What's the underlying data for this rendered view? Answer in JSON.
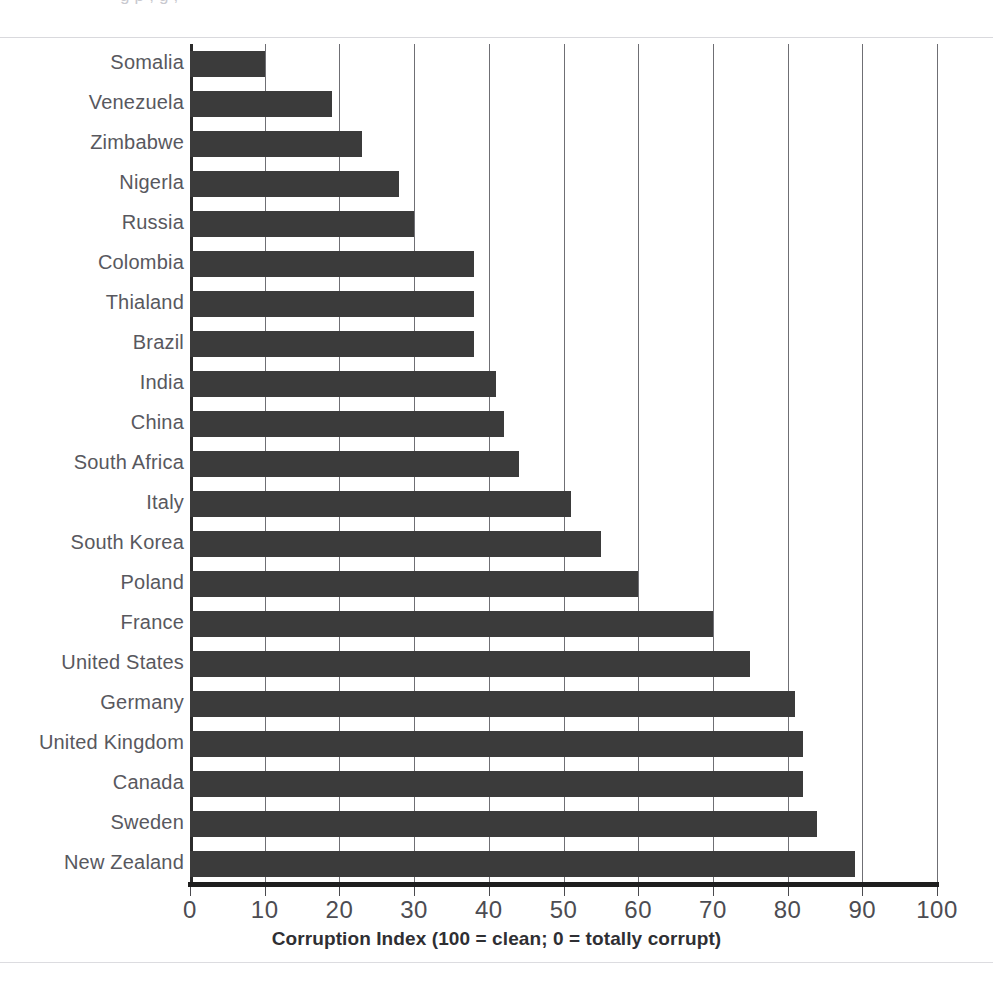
{
  "figure": {
    "top_clipped_text": "g                p                                  ,   g    ,",
    "background_color": "#ffffff",
    "bar_color": "#3b3b3b",
    "gridline_color": "#6f6f74",
    "axis_color": "#1e1e1e",
    "label_color": "#58585e"
  },
  "chart_data": {
    "type": "bar",
    "orientation": "horizontal",
    "title": "",
    "subtitle": "",
    "xlabel": "Corruption Index (100 = clean; 0 = totally corrupt)",
    "ylabel": "",
    "xlim": [
      0,
      100
    ],
    "xticks": [
      0,
      10,
      20,
      30,
      40,
      50,
      60,
      70,
      80,
      90,
      100
    ],
    "xticklabels": [
      "0",
      "10",
      "20",
      "30",
      "40",
      "50",
      "60",
      "70",
      "80",
      "90",
      "100"
    ],
    "grid": "vertical",
    "legend": "none",
    "categories": [
      "Somalia",
      "Venezuela",
      "Zimbabwe",
      "Nigerla",
      "Russia",
      "Colombia",
      "Thialand",
      "Brazil",
      "India",
      "China",
      "South Africa",
      "Italy",
      "South Korea",
      "Poland",
      "France",
      "United States",
      "Germany",
      "United Kingdom",
      "Canada",
      "Sweden",
      "New Zealand"
    ],
    "values": [
      10,
      19,
      23,
      28,
      30,
      38,
      38,
      38,
      41,
      42,
      44,
      51,
      55,
      60,
      70,
      75,
      81,
      82,
      82,
      84,
      89
    ],
    "series": [
      {
        "name": "Corruption Index",
        "values": [
          10,
          19,
          23,
          28,
          30,
          38,
          38,
          38,
          41,
          42,
          44,
          51,
          55,
          60,
          70,
          75,
          81,
          82,
          82,
          84,
          89
        ]
      }
    ]
  }
}
